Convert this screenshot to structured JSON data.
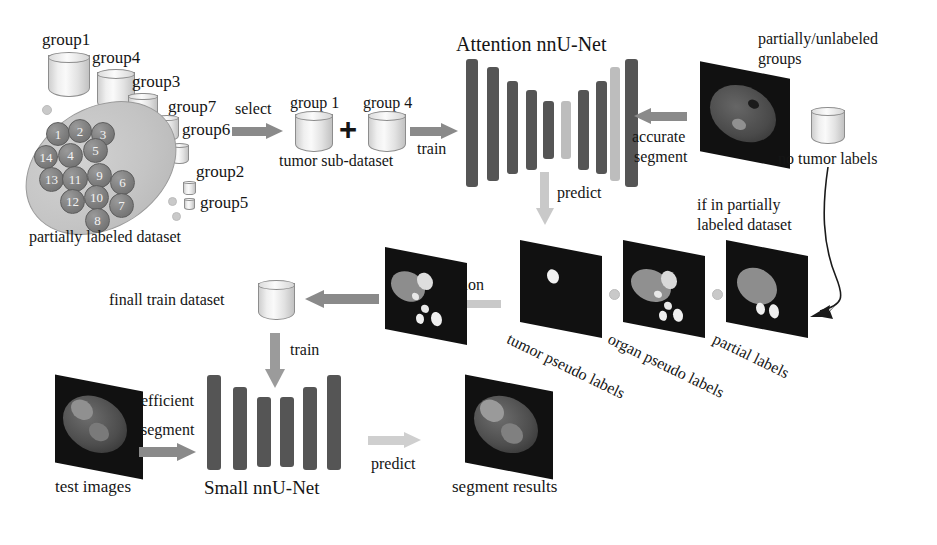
{
  "groups": [
    {
      "name": "group1",
      "label": "group1"
    },
    {
      "name": "group4",
      "label": "group4"
    },
    {
      "name": "group3",
      "label": "group3"
    },
    {
      "name": "group7",
      "label": "group7"
    },
    {
      "name": "group6",
      "label": "group6"
    },
    {
      "name": "group2",
      "label": "group2"
    },
    {
      "name": "group5",
      "label": "group5"
    }
  ],
  "dataset": {
    "caption": "partially labeled dataset",
    "nodes": [
      "1",
      "2",
      "3",
      "14",
      "4",
      "5",
      "13",
      "11",
      "9",
      "6",
      "12",
      "10",
      "7",
      "8"
    ]
  },
  "select": {
    "label": "select",
    "group_one": "group 1",
    "plus": "+",
    "group_four": "group 4",
    "caption": "tumor sub-dataset",
    "train": "train"
  },
  "attention_net": {
    "title": "Attention nnU-Net",
    "predict": "predict",
    "accurate": "accurate",
    "segment": "segment"
  },
  "unlabeled": {
    "line1": "partially/unlabeled",
    "line2": "groups",
    "no_tumor": "no tumor labels"
  },
  "condition": {
    "line1": "if in partially",
    "line2": "labeled dataset"
  },
  "pseudo": {
    "tumor": "tumor pseudo labels",
    "organ": "organ pseudo labels",
    "partial": "partial labels",
    "fusion": "fusion"
  },
  "final": {
    "dataset_label": "finall train dataset",
    "train": "train"
  },
  "bottom": {
    "test_images": "test images",
    "efficient": "efficient",
    "segment": "segment",
    "small_net": "Small nnU-Net",
    "predict": "predict",
    "results": "segment results"
  },
  "colors": {
    "bar_dark": "#555555",
    "bar_light": "#bdbdbd",
    "arrow_dark": "#8a8a8a",
    "arrow_light": "#c9c9c9",
    "slice_bg": "#101010",
    "text": "#151515"
  }
}
